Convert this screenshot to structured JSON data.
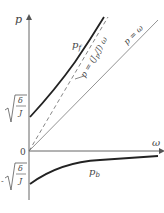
{
  "axes": {
    "y_label": "p",
    "x_label": "ω",
    "origin_label": "0"
  },
  "ticks": {
    "upper": {
      "sign": "",
      "num": "δ",
      "den": "J"
    },
    "lower": {
      "sign": "-",
      "num": "δ",
      "den": "J"
    }
  },
  "curves": {
    "pf_label": "p",
    "pf_sub": "f",
    "pb_label": "p",
    "pb_sub": "b",
    "asymptote_label": "p = (J",
    "asymptote_sub": "p",
    "asymptote_tail": "/J) ω",
    "identity_label": "p = ω"
  },
  "colors": {
    "axis": "#555555",
    "curve": "#222222",
    "thin": "#666666"
  }
}
